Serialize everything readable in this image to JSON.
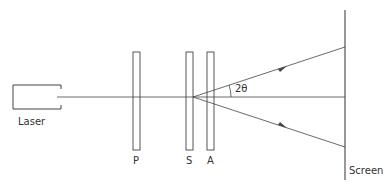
{
  "labels": {
    "laser": "Laser",
    "polarizer": "P",
    "sample": "S",
    "analyzer": "A",
    "screen": "Screen",
    "angle": "2θ"
  },
  "colors": {
    "line": "#444444",
    "background": "#ffffff"
  }
}
